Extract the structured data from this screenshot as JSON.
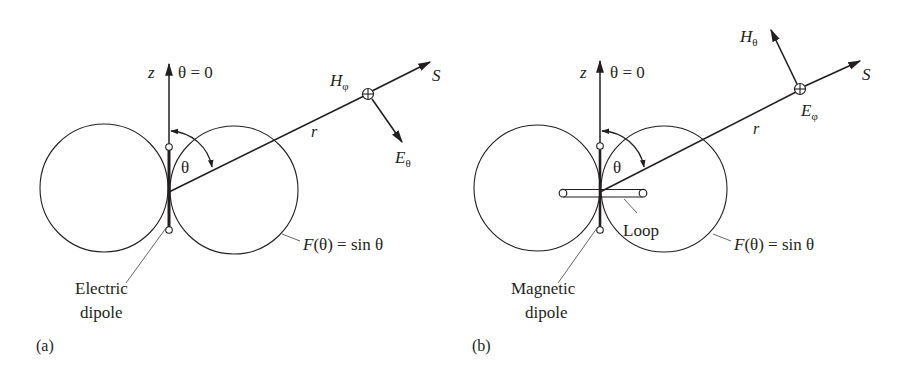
{
  "figure": {
    "colors": {
      "ink": "#231f20",
      "background": "#ffffff",
      "leader": "#555555"
    },
    "panels": [
      {
        "id": "a",
        "panel_label": "(a)",
        "axis_label": "z",
        "axis_condition": "θ = 0",
        "angle_label": "θ",
        "radius_label": "r",
        "direction_label": "S",
        "field_at_point": {
          "main": "H",
          "sub": "φ"
        },
        "field_arrow": {
          "main": "E",
          "sub": "θ"
        },
        "pattern_label": {
          "func": "F",
          "arg": "(θ) = sin θ"
        },
        "source_label_line1": "Electric",
        "source_label_line2": "dipole"
      },
      {
        "id": "b",
        "panel_label": "(b)",
        "axis_label": "z",
        "axis_condition": "θ = 0",
        "angle_label": "θ",
        "radius_label": "r",
        "direction_label": "S",
        "field_at_point": {
          "main": "E",
          "sub": "φ"
        },
        "field_arrow": {
          "main": "H",
          "sub": "θ"
        },
        "loop_label": "Loop",
        "pattern_label": {
          "func": "F",
          "arg": "(θ) = sin θ"
        },
        "source_label_line1": "Magnetic",
        "source_label_line2": "dipole"
      }
    ]
  }
}
